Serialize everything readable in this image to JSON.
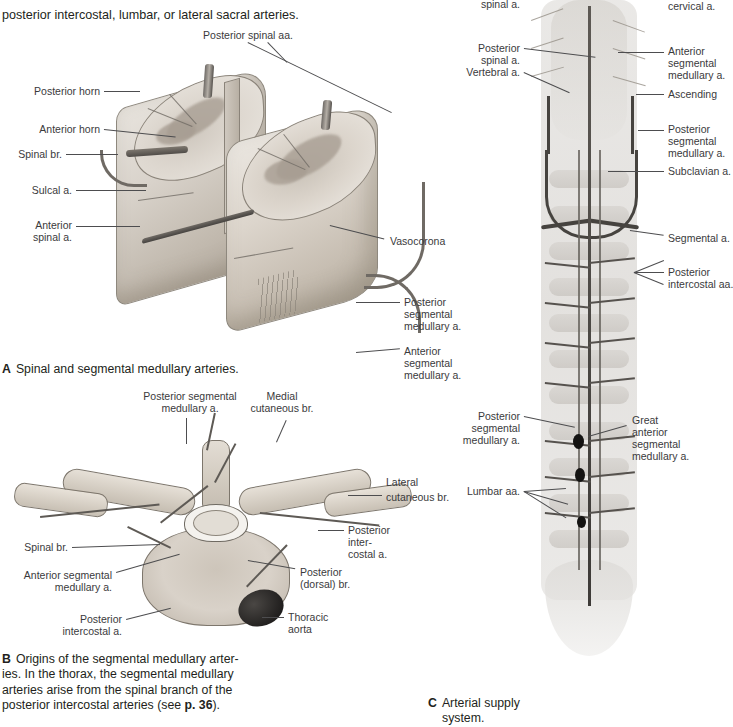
{
  "intro_text": {
    "line1": "posterior intercostal, lumbar, or lateral sacral arteries."
  },
  "figure_a": {
    "caption_letter": "A",
    "caption_text": "Spinal and segmental medullary arteries.",
    "labels": [
      "Posterior spinal aa.",
      "Posterior horn",
      "Anterior horn",
      "Spinal br.",
      "Sulcal a.",
      "Anterior\nspinal a.",
      "Vasocorona",
      "Posterior\nsegmental\nmedullary a.",
      "Anterior\nsegmental\nmedullary a."
    ],
    "label_posterior_spinal_aa": "Posterior spinal aa.",
    "label_posterior_horn": "Posterior horn",
    "label_anterior_horn": "Anterior horn",
    "label_spinal_br": "Spinal br.",
    "label_sulcal_a": "Sulcal a.",
    "label_anterior_spinal_a_l1": "Anterior",
    "label_anterior_spinal_a_l2": "spinal a.",
    "label_vasocorona": "Vasocorona",
    "label_post_seg_med_l1": "Posterior",
    "label_post_seg_med_l2": "segmental",
    "label_post_seg_med_l3": "medullary a.",
    "label_ant_seg_med_l1": "Anterior",
    "label_ant_seg_med_l2": "segmental",
    "label_ant_seg_med_l3": "medullary a."
  },
  "figure_b": {
    "caption_letter": "B",
    "caption_line1": "Origins of the segmental medullary arter-",
    "caption_line2": "ies. In the thorax, the segmental medullary",
    "caption_line3": "arteries arise from the spinal branch of the",
    "caption_line4_a": "posterior intercostal arteries (see ",
    "caption_line4_bold": "p. 36",
    "caption_line4_b": ").",
    "label_post_seg_med_l1": "Posterior segmental",
    "label_post_seg_med_l2": "medullary a.",
    "label_medial_cut_l1": "Medial",
    "label_medial_cut_l2": "cutaneous br.",
    "label_lateral_cut_l1": "Lateral",
    "label_lateral_cut_l2": "cutaneous br.",
    "label_post_intercostal_l1": "Posterior",
    "label_post_intercostal_l2": "inter-",
    "label_post_intercostal_l3": "costal a.",
    "label_posterior_dorsal_l1": "Posterior",
    "label_posterior_dorsal_l2": "(dorsal) br.",
    "label_spinal_br": "Spinal br.",
    "label_ant_seg_med_l1": "Anterior segmental",
    "label_ant_seg_med_l2": "medullary a.",
    "label_post_intercostal_bl_l1": "Posterior",
    "label_post_intercostal_bl_l2": "intercostal a.",
    "label_thoracic_aorta_l1": "Thoracic",
    "label_thoracic_aorta_l2": "aorta"
  },
  "figure_c": {
    "caption_letter": "C",
    "caption_line1": "Arterial supply",
    "caption_line2": "system.",
    "label_anterior_spinal_a": "spinal a.",
    "label_posterior_spinal_l1": "Posterior",
    "label_posterior_spinal_l2": "spinal a.",
    "label_vertebral_a": "Vertebral a.",
    "label_ant_seg_med_l1": "Anterior",
    "label_ant_seg_med_l2": "segmental",
    "label_ant_seg_med_l3": "medullary a.",
    "label_ascending_cervical_l1": "Ascending",
    "label_ascending_cervical_l2": "cervical a.",
    "label_post_seg_med_l1": "Posterior",
    "label_post_seg_med_l2": "segmental",
    "label_post_seg_med_l3": "medullary a.",
    "label_subclavian_a": "Subclavian a.",
    "label_segmental_a": "Segmental a.",
    "label_post_intercostal_aa_l1": "Posterior",
    "label_post_intercostal_aa_l2": "intercostal aa.",
    "label_post_seg_med2_l1": "Posterior",
    "label_post_seg_med2_l2": "segmental",
    "label_post_seg_med2_l3": "medullary a.",
    "label_great_ant_seg_med_l1": "Great",
    "label_great_ant_seg_med_l2": "anterior",
    "label_great_ant_seg_med_l3": "segmental",
    "label_great_ant_seg_med_l4": "medullary a.",
    "label_lumbar_aa": "Lumbar aa."
  },
  "colors": {
    "text": "#231f20",
    "label_text": "#3a3a3c",
    "leader_line": "#4d4d4f",
    "vessel_dark": "#46433f",
    "aorta": "#1b1a19",
    "bone_light": "#ded8d0"
  }
}
